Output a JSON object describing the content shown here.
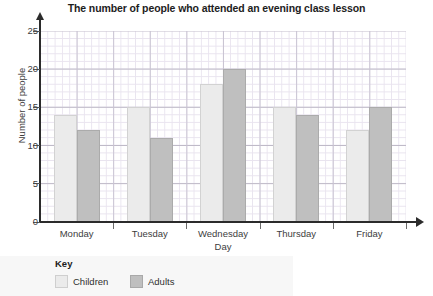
{
  "chart_data": {
    "type": "bar",
    "title": "The number of people who attended an evening class lesson",
    "xlabel": "Day",
    "ylabel": "Number of people",
    "categories": [
      "Monday",
      "Tuesday",
      "Wednesday",
      "Thursday",
      "Friday"
    ],
    "series": [
      {
        "name": "Children",
        "values": [
          14,
          15,
          18,
          15,
          12
        ],
        "color": "#ebebeb"
      },
      {
        "name": "Adults",
        "values": [
          12,
          11,
          20,
          14,
          15
        ],
        "color": "#bfbfbf"
      }
    ],
    "ylim": [
      0,
      25
    ],
    "ytick_labels": [
      "0",
      "5",
      "10",
      "15",
      "20",
      "25"
    ],
    "ytick_values": [
      0,
      5,
      10,
      15,
      20,
      25
    ],
    "grid": true,
    "legend_position": "bottom-left"
  },
  "legend": {
    "title": "Key",
    "entries": [
      {
        "label": "Children"
      },
      {
        "label": "Adults"
      }
    ]
  }
}
